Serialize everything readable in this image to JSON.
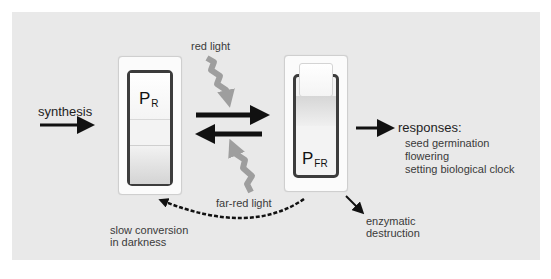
{
  "diagram": {
    "colors": {
      "panel_background": "#e9e9e9",
      "arrow": "#111111",
      "light_arrow": "#9e9e9e",
      "switch_frame": "#3c3c3c",
      "text": "#333333"
    },
    "nodes": {
      "pr": {
        "main": "P",
        "sub": "R",
        "state": "switch rocker down"
      },
      "pfr": {
        "main": "P",
        "sub": "FR",
        "state": "switch rocker up"
      }
    },
    "labels": {
      "synthesis": "synthesis",
      "red_light": "red light",
      "far_red_light": "far-red light",
      "slow_conversion_line1": "slow conversion",
      "slow_conversion_line2": "in darkness",
      "enzymatic_line1": "enzymatic",
      "enzymatic_line2": "destruction",
      "responses_title": "responses:"
    },
    "responses": [
      "seed germination",
      "flowering",
      "setting biological clock"
    ],
    "edges": [
      {
        "from": "synthesis",
        "to": "pr",
        "style": "solid-black"
      },
      {
        "from": "pr",
        "to": "pfr",
        "style": "solid-black",
        "trigger": "red light"
      },
      {
        "from": "pfr",
        "to": "pr",
        "style": "solid-black",
        "trigger": "far-red light"
      },
      {
        "from": "pfr",
        "to": "pr",
        "style": "dashed-black-arc",
        "label": "slow conversion in darkness"
      },
      {
        "from": "pfr",
        "to": "responses",
        "style": "solid-black"
      },
      {
        "from": "pfr",
        "to": "enzymatic destruction",
        "style": "thin-black"
      }
    ]
  }
}
